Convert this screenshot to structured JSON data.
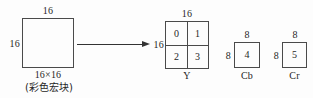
{
  "diagram": {
    "stroke_color": "#4a4a4a",
    "arrow_color": "#333333",
    "background_color": "#fdfdfd",
    "source": {
      "top_dimension": "16",
      "left_dimension": "16",
      "size_label": "16×16",
      "type_label": "(彩色宏块)"
    },
    "arrow": {
      "icon": "right-arrow-icon",
      "direction": "right"
    },
    "luma": {
      "name": "Y",
      "top_dimension": "16",
      "left_dimension": "16",
      "cells": [
        "0",
        "1",
        "2",
        "3"
      ]
    },
    "chroma_cb": {
      "name": "Cb",
      "top_dimension": "8",
      "left_dimension": "8",
      "cell": "4"
    },
    "chroma_cr": {
      "name": "Cr",
      "top_dimension": "8",
      "left_dimension": "8",
      "cell": "5"
    }
  }
}
